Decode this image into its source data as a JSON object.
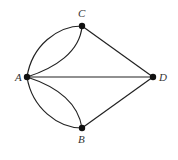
{
  "diagram": {
    "type": "multigraph",
    "nodes": [
      {
        "id": "A",
        "label": "A",
        "x": 27,
        "y": 77,
        "lx": 15,
        "ly": 81
      },
      {
        "id": "C",
        "label": "C",
        "x": 82,
        "y": 26,
        "lx": 78,
        "ly": 17
      },
      {
        "id": "D",
        "label": "D",
        "x": 153,
        "y": 77,
        "lx": 159,
        "ly": 81
      },
      {
        "id": "B",
        "label": "B",
        "x": 82,
        "y": 128,
        "lx": 78,
        "ly": 143
      }
    ],
    "edges": [
      {
        "from": "A",
        "to": "C",
        "shape": "curve-outer"
      },
      {
        "from": "A",
        "to": "C",
        "shape": "curve-inner"
      },
      {
        "from": "A",
        "to": "B",
        "shape": "curve-outer"
      },
      {
        "from": "A",
        "to": "B",
        "shape": "curve-inner"
      },
      {
        "from": "A",
        "to": "D",
        "shape": "straight"
      },
      {
        "from": "C",
        "to": "D",
        "shape": "straight"
      },
      {
        "from": "B",
        "to": "D",
        "shape": "straight"
      }
    ],
    "colors": {
      "stroke": "#222222",
      "node": "#111111",
      "label": "#333333",
      "background": "#ffffff"
    }
  }
}
